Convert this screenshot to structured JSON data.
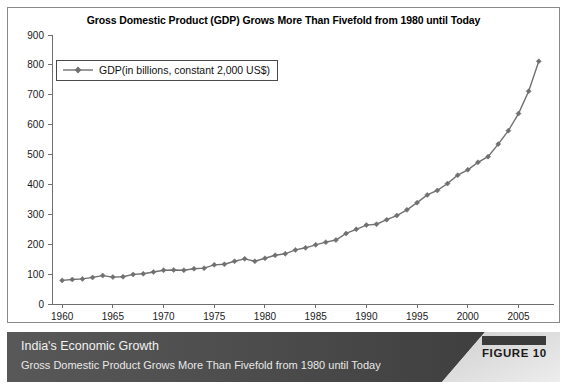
{
  "chart_data": {
    "type": "line",
    "title": "Gross Domestic Product (GDP) Grows More Than Fivefold from 1980 until Today",
    "xlabel": "",
    "ylabel": "",
    "xlim": [
      1959,
      2008.5
    ],
    "ylim": [
      0,
      900
    ],
    "grid": false,
    "legend_position": "top-left",
    "y_ticks": [
      0,
      100,
      200,
      300,
      400,
      500,
      600,
      700,
      800,
      900
    ],
    "x_ticks": [
      1960,
      1965,
      1970,
      1975,
      1980,
      1985,
      1990,
      1995,
      2000,
      2005
    ],
    "series": [
      {
        "name": "GDP(in billions, constant 2,000 US$)",
        "color": "#707070",
        "marker": "diamond",
        "x": [
          1960,
          1961,
          1962,
          1963,
          1964,
          1965,
          1966,
          1967,
          1968,
          1969,
          1970,
          1971,
          1972,
          1973,
          1974,
          1975,
          1976,
          1977,
          1978,
          1979,
          1980,
          1981,
          1982,
          1983,
          1984,
          1985,
          1986,
          1987,
          1988,
          1989,
          1990,
          1991,
          1992,
          1993,
          1994,
          1995,
          1996,
          1997,
          1998,
          1999,
          2000,
          2001,
          2002,
          2003,
          2004,
          2005,
          2006,
          2007
        ],
        "values": [
          79,
          82,
          84,
          89,
          95,
          90,
          91,
          99,
          101,
          107,
          113,
          114,
          113,
          118,
          120,
          131,
          133,
          143,
          151,
          143,
          153,
          163,
          168,
          181,
          188,
          198,
          207,
          214,
          236,
          250,
          264,
          267,
          282,
          296,
          315,
          339,
          365,
          380,
          403,
          431,
          449,
          474,
          493,
          535,
          580,
          637,
          712,
          812
        ]
      }
    ]
  },
  "legend": {
    "label": "GDP(in billions, constant 2,000 US$)"
  },
  "caption": {
    "title": "India's Economic Growth",
    "subtitle": "Gross Domestic Product Grows More Than Fivefold from 1980 until Today",
    "figure_label": "FIGURE 10"
  },
  "colors": {
    "series": "#707070",
    "axis": "#6f6f6f",
    "caption_bar_dark": "#4a4a4a",
    "caption_bar_light": "#d6d6d6",
    "badge_bar": "#3b3b3b"
  }
}
